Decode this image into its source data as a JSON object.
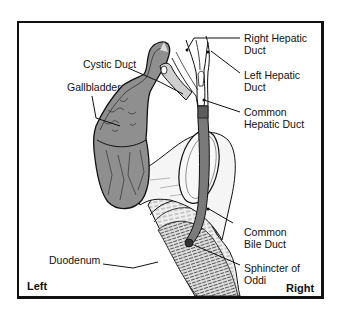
{
  "diagram": {
    "type": "anatomical-illustration",
    "orientation": {
      "left": "Left",
      "right": "Right"
    },
    "labels": {
      "cystic_duct": "Cystic Duct",
      "gallbladder": "Gallbladder",
      "right_hepatic_duct": {
        "line1": "Right Hepatic",
        "line2": "Duct"
      },
      "left_hepatic_duct": {
        "line1": "Left Hepatic",
        "line2": "Duct"
      },
      "common_hepatic_duct": {
        "line1": "Common",
        "line2": "Hepatic Duct"
      },
      "common_bile_duct": {
        "line1": "Common",
        "line2": "Bile Duct"
      },
      "sphincter_of_oddi": {
        "line1": "Sphincter of",
        "line2": "Oddi"
      },
      "duodenum": "Duodenum"
    },
    "colors": {
      "outline": "#111111",
      "gallbladder_fill": "#8f8f8f",
      "duct_fill": "#7a7a7a",
      "duodenum_fill": "#ededed",
      "pancreas_fill": "#f4f4f4",
      "background": "#ffffff"
    }
  }
}
